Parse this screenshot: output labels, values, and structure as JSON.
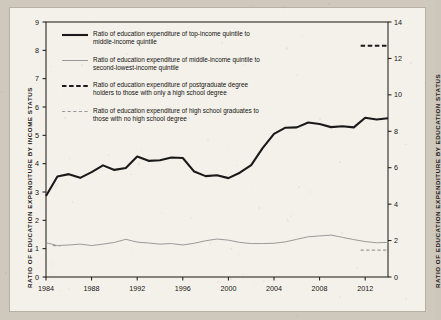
{
  "figure": {
    "background_color": "#cfc8bc",
    "paper_color": "#f4f1ea",
    "ink_color": "#171513",
    "series_dark_color": "#1a1a1a",
    "series_light_color": "#9a9a9a"
  },
  "axes": {
    "left": {
      "title": "RATIO OF EDUCATION EXPENDITURE BY INCOME STATUS",
      "ticks": [
        "0",
        "1",
        "2",
        "3",
        "4",
        "5",
        "6",
        "7",
        "8",
        "9"
      ],
      "min": 0,
      "max": 9
    },
    "right": {
      "title": "RATIO OF EDUCATION EXPENDITURE BY EDUCATION STATUS",
      "ticks": [
        "0",
        "2",
        "4",
        "6",
        "8",
        "10",
        "12",
        "14"
      ],
      "min": 0,
      "max": 14
    },
    "bottom": {
      "ticks": [
        "1984",
        "1988",
        "1992",
        "1996",
        "2000",
        "2004",
        "2008",
        "2012"
      ],
      "min": 1984,
      "max": 2014
    }
  },
  "legend": {
    "items": [
      {
        "label": "Ratio of education expenditure of top-income quintile to\nmiddle-income quintile",
        "style": "solid-thick-dark"
      },
      {
        "label": "Ratio of education expenditure of middle-income quintile to\nsecond-lowest-income quintile",
        "style": "solid-thin-light"
      },
      {
        "label": "Ratio of education expenditure of postgraduate degree\nholders to those with only a high school degree",
        "style": "dashed-dark"
      },
      {
        "label": "Ratio of education expenditure of high school graduates to\nthose with no high school degree",
        "style": "dashed-light"
      }
    ]
  },
  "chart_data": {
    "type": "line",
    "title": "",
    "xlabel": "",
    "ylabel": "RATIO OF EDUCATION EXPENDITURE BY INCOME STATUS",
    "ylabel_right": "RATIO OF EDUCATION EXPENDITURE BY EDUCATION STATUS",
    "xlim": [
      1984,
      2014
    ],
    "ylim": [
      0,
      9
    ],
    "ylim_right": [
      0,
      14
    ],
    "grid": false,
    "legend_position": "upper-left-inside",
    "x": [
      1984,
      1985,
      1986,
      1987,
      1988,
      1989,
      1990,
      1991,
      1992,
      1993,
      1994,
      1995,
      1996,
      1997,
      1998,
      1999,
      2000,
      2001,
      2002,
      2003,
      2004,
      2005,
      2006,
      2007,
      2008,
      2009,
      2010,
      2011,
      2012,
      2013,
      2014
    ],
    "series": [
      {
        "name": "Ratio of education expenditure of top-income quintile to middle-income quintile",
        "axis": "left",
        "style": "solid-thick-dark",
        "values": [
          2.86,
          3.55,
          3.63,
          3.5,
          3.7,
          3.94,
          3.78,
          3.85,
          4.25,
          4.1,
          4.12,
          4.22,
          4.2,
          3.72,
          3.56,
          3.59,
          3.49,
          3.68,
          3.95,
          4.55,
          5.05,
          5.27,
          5.28,
          5.45,
          5.4,
          5.29,
          5.32,
          5.28,
          5.62,
          5.56,
          5.6
        ]
      },
      {
        "name": "Ratio of education expenditure of middle-income quintile to second-lowest-income quintile",
        "axis": "left",
        "style": "solid-thin-light",
        "values": [
          1.21,
          1.11,
          1.13,
          1.16,
          1.11,
          1.16,
          1.22,
          1.33,
          1.23,
          1.2,
          1.16,
          1.18,
          1.13,
          1.19,
          1.28,
          1.34,
          1.3,
          1.22,
          1.18,
          1.18,
          1.19,
          1.24,
          1.33,
          1.42,
          1.45,
          1.48,
          1.4,
          1.32,
          1.25,
          1.21,
          1.22
        ]
      },
      {
        "name": "Ratio of education expenditure of postgraduate degree holders to those with only a high school degree",
        "axis": "right",
        "style": "dashed-dark",
        "x": [
          2011.6,
          2014
        ],
        "values": [
          12.7,
          12.7
        ]
      },
      {
        "name": "Ratio of education expenditure of high school graduates to those with no high school degree",
        "axis": "right",
        "style": "dashed-light",
        "x": [
          2011.6,
          2014
        ],
        "values": [
          1.48,
          1.48
        ]
      },
      {
        "name": "Ratio of education expenditure of high school graduates to those with no high school degree (1985 marker)",
        "axis": "left",
        "style": "dashed-light",
        "x": [
          1984.6,
          1985.3
        ],
        "values": [
          1.11,
          1.11
        ]
      }
    ]
  }
}
